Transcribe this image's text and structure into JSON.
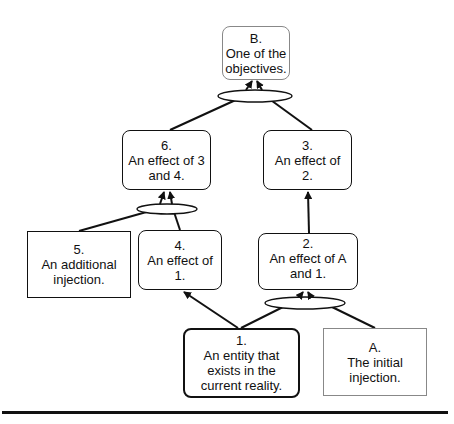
{
  "nodes": {
    "B": {
      "id": "B.",
      "text": [
        "One of the",
        "objectives."
      ]
    },
    "n6": {
      "id": "6.",
      "text": [
        "An effect of 3",
        "and 4."
      ]
    },
    "n3": {
      "id": "3.",
      "text": [
        "An effect of",
        "2."
      ]
    },
    "n5": {
      "id": "5.",
      "text": [
        "An additional",
        "injection."
      ]
    },
    "n4": {
      "id": "4.",
      "text": [
        "An effect of",
        "1."
      ]
    },
    "n2": {
      "id": "2.",
      "text": [
        "An effect of A",
        "and 1."
      ]
    },
    "n1": {
      "id": "1.",
      "text": [
        "An entity that",
        "exists in the",
        "current reality."
      ]
    },
    "A": {
      "id": "A.",
      "text": [
        "The initial",
        "injection."
      ]
    }
  },
  "connectors": [
    {
      "type": "and-ellipse",
      "inputs": [
        "6",
        "3"
      ],
      "output": "B"
    },
    {
      "type": "and-ellipse",
      "inputs": [
        "5",
        "4"
      ],
      "output": "6"
    },
    {
      "type": "and-ellipse",
      "inputs": [
        "1",
        "A"
      ],
      "output": "2"
    },
    {
      "type": "arrow",
      "from": "1",
      "to": "4"
    },
    {
      "type": "arrow",
      "from": "2",
      "to": "3"
    }
  ],
  "colors": {
    "line": "#111111",
    "light_border": "#888888",
    "background": "#ffffff"
  }
}
